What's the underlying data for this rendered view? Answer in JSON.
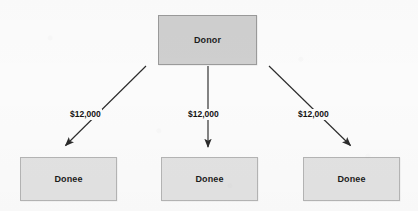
{
  "diagram": {
    "type": "flow-diagram",
    "background_color": "#fbfbfb",
    "donor": {
      "label": "Donor",
      "fill_color": "#cfcfcf",
      "border_color": "#9a9a9a",
      "text_color": "#1c1c1c"
    },
    "donees": [
      {
        "label": "Donee",
        "fill_color": "#e2e2e2",
        "border_color": "#b4b4b4"
      },
      {
        "label": "Donee",
        "fill_color": "#e2e2e2",
        "border_color": "#b4b4b4"
      },
      {
        "label": "Donee",
        "fill_color": "#e2e2e2",
        "border_color": "#b4b4b4"
      }
    ],
    "edges": [
      {
        "amount": "$12,000",
        "from": "Donor",
        "to": "Donee",
        "direction": "down-left",
        "arrow_color": "#2b2b2b"
      },
      {
        "amount": "$12,000",
        "from": "Donor",
        "to": "Donee",
        "direction": "down",
        "arrow_color": "#2b2b2b"
      },
      {
        "amount": "$12,000",
        "from": "Donor",
        "to": "Donee",
        "direction": "down-right",
        "arrow_color": "#2b2b2b"
      }
    ]
  }
}
